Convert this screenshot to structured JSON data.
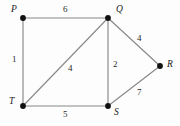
{
  "figure": {
    "type": "weighted-undirected-graph",
    "width": 180,
    "height": 126,
    "background_color": "#fdfdfd",
    "edge_color": "#888888",
    "node_color": "#111111",
    "label_color": "#1a1a1a"
  },
  "nodes": [
    {
      "id": "P",
      "label": "P",
      "x": 23,
      "y": 18,
      "label_x": 11,
      "label_y": 5
    },
    {
      "id": "Q",
      "label": "Q",
      "x": 108,
      "y": 18,
      "label_x": 116,
      "label_y": 5
    },
    {
      "id": "R",
      "label": "R",
      "x": 160,
      "y": 66,
      "label_x": 167,
      "label_y": 60
    },
    {
      "id": "S",
      "label": "S",
      "x": 108,
      "y": 106,
      "label_x": 114,
      "label_y": 108
    },
    {
      "id": "T",
      "label": "T",
      "x": 23,
      "y": 106,
      "label_x": 9,
      "label_y": 97
    }
  ],
  "edges": [
    {
      "from": "P",
      "to": "Q",
      "weight": "6",
      "x1": 23,
      "y1": 18,
      "x2": 108,
      "y2": 18,
      "label_x": 63,
      "label_y": 5
    },
    {
      "from": "P",
      "to": "T",
      "weight": "1",
      "x1": 23,
      "y1": 18,
      "x2": 23,
      "y2": 106,
      "label_x": 12,
      "label_y": 55
    },
    {
      "from": "T",
      "to": "Q",
      "weight": "4",
      "x1": 23,
      "y1": 106,
      "x2": 108,
      "y2": 18,
      "label_x": 68,
      "label_y": 64
    },
    {
      "from": "Q",
      "to": "S",
      "weight": "2",
      "x1": 108,
      "y1": 18,
      "x2": 108,
      "y2": 106,
      "label_x": 113,
      "label_y": 60
    },
    {
      "from": "Q",
      "to": "R",
      "weight": "4",
      "x1": 108,
      "y1": 18,
      "x2": 160,
      "y2": 66,
      "label_x": 137,
      "label_y": 34
    },
    {
      "from": "T",
      "to": "S",
      "weight": "5",
      "x1": 23,
      "y1": 106,
      "x2": 108,
      "y2": 106,
      "label_x": 63,
      "label_y": 110
    },
    {
      "from": "S",
      "to": "R",
      "weight": "7",
      "x1": 108,
      "y1": 106,
      "x2": 160,
      "y2": 66,
      "label_x": 137,
      "label_y": 88
    }
  ],
  "chart_data": {
    "type": "diagram",
    "title": "",
    "vertices": [
      "P",
      "Q",
      "R",
      "S",
      "T"
    ],
    "edges": [
      {
        "endpoints": [
          "P",
          "Q"
        ],
        "weight": 6
      },
      {
        "endpoints": [
          "P",
          "T"
        ],
        "weight": 1
      },
      {
        "endpoints": [
          "T",
          "Q"
        ],
        "weight": 4
      },
      {
        "endpoints": [
          "Q",
          "S"
        ],
        "weight": 2
      },
      {
        "endpoints": [
          "Q",
          "R"
        ],
        "weight": 4
      },
      {
        "endpoints": [
          "T",
          "S"
        ],
        "weight": 5
      },
      {
        "endpoints": [
          "S",
          "R"
        ],
        "weight": 7
      }
    ]
  }
}
